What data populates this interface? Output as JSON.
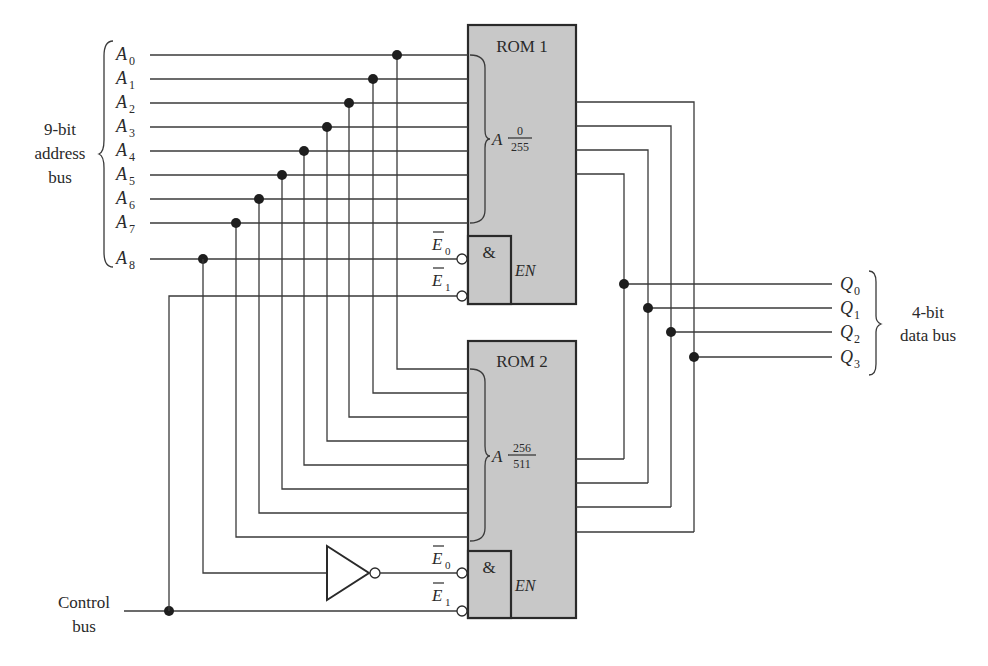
{
  "address_bus": {
    "label_lines": [
      "9-bit",
      "address",
      "bus"
    ],
    "lines": [
      {
        "name": "A",
        "sub": "0"
      },
      {
        "name": "A",
        "sub": "1"
      },
      {
        "name": "A",
        "sub": "2"
      },
      {
        "name": "A",
        "sub": "3"
      },
      {
        "name": "A",
        "sub": "4"
      },
      {
        "name": "A",
        "sub": "5"
      },
      {
        "name": "A",
        "sub": "6"
      },
      {
        "name": "A",
        "sub": "7"
      },
      {
        "name": "A",
        "sub": "8"
      }
    ]
  },
  "rom1": {
    "title": "ROM 1",
    "address_label": "A",
    "range_top": "0",
    "range_bottom": "255",
    "and_symbol": "&",
    "enable_label": "EN",
    "enable_inputs": [
      {
        "name": "E",
        "sub": "0",
        "active_low": true
      },
      {
        "name": "E",
        "sub": "1",
        "active_low": true
      }
    ]
  },
  "rom2": {
    "title": "ROM 2",
    "address_label": "A",
    "range_top": "256",
    "range_bottom": "511",
    "and_symbol": "&",
    "enable_label": "EN",
    "enable_inputs": [
      {
        "name": "E",
        "sub": "0",
        "active_low": true
      },
      {
        "name": "E",
        "sub": "1",
        "active_low": true
      }
    ]
  },
  "data_bus": {
    "label_lines": [
      "4-bit",
      "data bus"
    ],
    "lines": [
      {
        "name": "Q",
        "sub": "0"
      },
      {
        "name": "Q",
        "sub": "1"
      },
      {
        "name": "Q",
        "sub": "2"
      },
      {
        "name": "Q",
        "sub": "3"
      }
    ]
  },
  "control_bus": {
    "label_lines": [
      "Control",
      "bus"
    ]
  },
  "inverter": {
    "type": "NOT gate"
  },
  "colors": {
    "rom_fill": "#c8c8c8",
    "wire": "#3a3a3a",
    "background": "#ffffff"
  }
}
